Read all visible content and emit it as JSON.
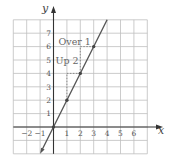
{
  "chart_data": {
    "type": "line",
    "title": "",
    "xlabel": "x",
    "ylabel": "y",
    "xlim": [
      -3,
      7
    ],
    "ylim": [
      -2,
      8
    ],
    "grid": true,
    "x_tick_labels": [
      "−2",
      "−1",
      "1",
      "2",
      "3",
      "4",
      "5",
      "6"
    ],
    "x_tick_values": [
      -2,
      -1,
      1,
      2,
      3,
      4,
      5,
      6
    ],
    "y_tick_labels": [
      "1",
      "2",
      "3",
      "4",
      "5",
      "6",
      "7"
    ],
    "y_tick_values": [
      1,
      2,
      3,
      4,
      5,
      6,
      7
    ],
    "series": [
      {
        "name": "y = 2x",
        "line_from": [
          -1,
          -2
        ],
        "line_to": [
          4,
          8
        ],
        "points": [
          [
            0,
            0
          ],
          [
            1,
            2
          ],
          [
            2,
            4
          ],
          [
            3,
            6
          ]
        ]
      }
    ],
    "annotations": [
      {
        "text": "Over 1",
        "x": 1.1,
        "y": 6.3
      },
      {
        "text": "Up 2",
        "x": 0.2,
        "y": 5
      }
    ],
    "dashed_guides": [
      [
        [
          1,
          2
        ],
        [
          1,
          4
        ]
      ],
      [
        [
          1,
          4
        ],
        [
          2,
          4
        ]
      ],
      [
        [
          2,
          4
        ],
        [
          2,
          6
        ]
      ],
      [
        [
          2,
          6
        ],
        [
          3,
          6
        ]
      ]
    ]
  },
  "labels": {
    "x_axis": "x",
    "y_axis": "y",
    "over": "Over 1",
    "up": "Up 2"
  },
  "colors": {
    "grid": "#bfbfbf",
    "axis": "#333333",
    "line": "#555555",
    "point": "#444444",
    "dashed": "#777777"
  }
}
